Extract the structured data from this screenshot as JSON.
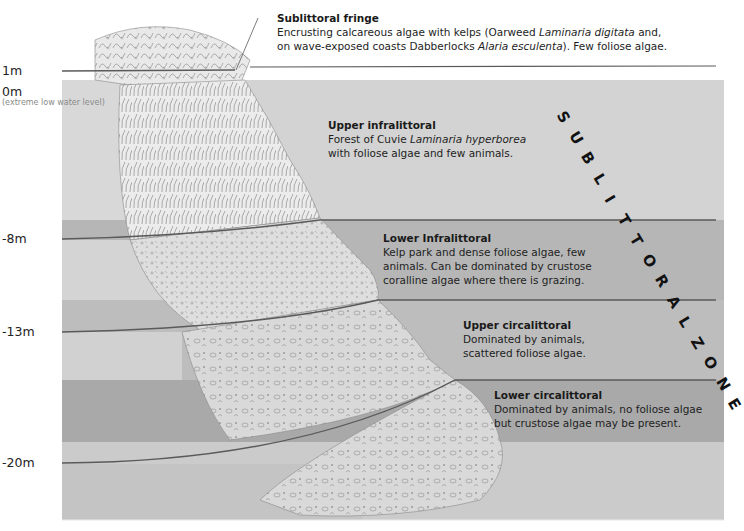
{
  "diagram": {
    "type": "sublittoral-zonation-cross-section",
    "vertical_label": "SUBLITTORAL ZONE",
    "depth_markers": [
      {
        "label": "1m",
        "y": 71
      },
      {
        "label": "0m",
        "y": 93,
        "note": "(extreme low water level)"
      },
      {
        "label": "-8m",
        "y": 239
      },
      {
        "label": "-13m",
        "y": 332
      },
      {
        "label": "-20m",
        "y": 463
      }
    ],
    "zones": [
      {
        "name": "Sublittoral fringe",
        "description_parts": [
          "Encrusting calcareous algae with kelps (Oarweed ",
          "Laminaria digitata",
          " and,",
          "on wave-exposed coasts Dabberlocks ",
          "Alaria esculenta",
          "). Few foliose algae."
        ]
      },
      {
        "name": "Upper infralittoral",
        "description_parts": [
          "Forest of Cuvie ",
          "Laminaria hyperborea",
          "with foliose algae and few animals."
        ]
      },
      {
        "name": "Lower Infralittoral",
        "description_lines": [
          "Kelp park and dense foliose algae, few",
          "animals. Can be dominated by crustose",
          "coralline algae where there is grazing."
        ]
      },
      {
        "name": "Upper circalittoral",
        "description_lines": [
          "Dominated by animals,",
          "scattered foliose algae."
        ]
      },
      {
        "name": "Lower circalittoral",
        "description_lines": [
          "Dominated by animals, no foliose algae",
          "but crustose algae may be present."
        ]
      }
    ],
    "colors": {
      "band_upper_infralittoral": "#d2d2d2",
      "band_lower_infralittoral": "#b4b4b4",
      "band_upper_circalittoral": "#bdbdbd",
      "band_lower_circalittoral": "#aaaaaa",
      "band_bottom": "#cfcfcf",
      "boundary_line": "#5a5a5a",
      "rock_sketch": "#8c8c8c"
    }
  }
}
